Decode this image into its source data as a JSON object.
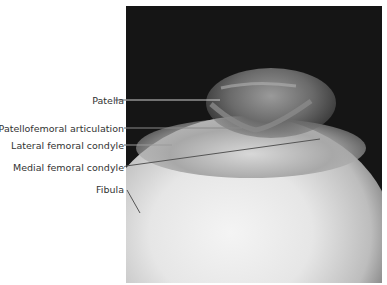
{
  "figure": {
    "labels": [
      {
        "id": "patella",
        "text": "Patella"
      },
      {
        "id": "patellofemoral",
        "text": "Patellofemoral articulation"
      },
      {
        "id": "lateral",
        "text": "Lateral femoral condyle"
      },
      {
        "id": "medial",
        "text": "Medial femoral condyle"
      },
      {
        "id": "fibula",
        "text": "Fibula"
      }
    ]
  }
}
